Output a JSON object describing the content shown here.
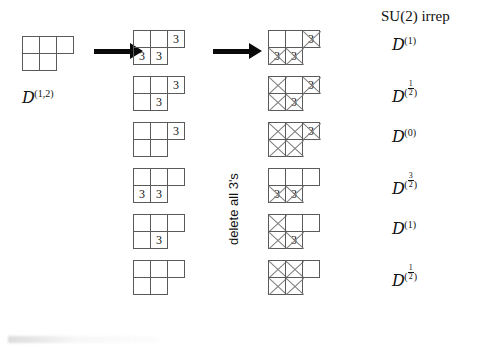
{
  "figure": {
    "header_label": "SU(2) irrep",
    "transform_label": "delete all 3's",
    "source_label": {
      "symbol": "D",
      "superscript": "(1,2)"
    }
  },
  "arrows": [
    {
      "name": "arrow-1",
      "x": 94,
      "y": 46,
      "length": 38
    },
    {
      "name": "arrow-2",
      "x": 213,
      "y": 46,
      "length": 38
    }
  ],
  "source_tableau": {
    "name": "source-tableau",
    "rows": [
      [
        {
          "text": ""
        },
        {
          "text": ""
        },
        {
          "text": ""
        }
      ],
      [
        {
          "text": ""
        },
        {
          "text": ""
        }
      ]
    ]
  },
  "rows": [
    {
      "name": "row-1",
      "filled": {
        "rows": [
          [
            {
              "text": ""
            },
            {
              "text": ""
            },
            {
              "text": "3"
            }
          ],
          [
            {
              "text": "3"
            },
            {
              "text": "3"
            }
          ]
        ]
      },
      "reduced": {
        "rows": [
          [
            {
              "text": "",
              "deleted": false
            },
            {
              "text": "",
              "deleted": false
            },
            {
              "text": "3",
              "deleted": true
            }
          ],
          [
            {
              "text": "3",
              "deleted": true
            },
            {
              "text": "3",
              "deleted": true
            }
          ]
        ]
      },
      "irrep": {
        "symbol": "D",
        "superscript": "(1)",
        "num": "",
        "den": ""
      }
    },
    {
      "name": "row-2",
      "filled": {
        "rows": [
          [
            {
              "text": ""
            },
            {
              "text": ""
            },
            {
              "text": "3"
            }
          ],
          [
            {
              "text": ""
            },
            {
              "text": "3"
            }
          ]
        ]
      },
      "reduced": {
        "rows": [
          [
            {
              "text": "",
              "deleted": true
            },
            {
              "text": "",
              "deleted": false
            },
            {
              "text": "3",
              "deleted": true
            }
          ],
          [
            {
              "text": "",
              "deleted": true
            },
            {
              "text": "3",
              "deleted": true
            }
          ]
        ]
      },
      "irrep": {
        "symbol": "D",
        "superscript": "",
        "num": "1",
        "den": "2"
      }
    },
    {
      "name": "row-3",
      "filled": {
        "rows": [
          [
            {
              "text": ""
            },
            {
              "text": ""
            },
            {
              "text": "3"
            }
          ],
          [
            {
              "text": ""
            },
            {
              "text": ""
            }
          ]
        ]
      },
      "reduced": {
        "rows": [
          [
            {
              "text": "",
              "deleted": true
            },
            {
              "text": "",
              "deleted": true
            },
            {
              "text": "3",
              "deleted": true
            }
          ],
          [
            {
              "text": "",
              "deleted": true
            },
            {
              "text": "",
              "deleted": true
            }
          ]
        ]
      },
      "irrep": {
        "symbol": "D",
        "superscript": "(0)",
        "num": "",
        "den": ""
      }
    },
    {
      "name": "row-4",
      "filled": {
        "rows": [
          [
            {
              "text": ""
            },
            {
              "text": ""
            },
            {
              "text": ""
            }
          ],
          [
            {
              "text": "3"
            },
            {
              "text": "3"
            }
          ]
        ]
      },
      "reduced": {
        "rows": [
          [
            {
              "text": "",
              "deleted": false
            },
            {
              "text": "",
              "deleted": false
            },
            {
              "text": "",
              "deleted": false
            }
          ],
          [
            {
              "text": "3",
              "deleted": true
            },
            {
              "text": "3",
              "deleted": true
            }
          ]
        ]
      },
      "irrep": {
        "symbol": "D",
        "superscript": "",
        "num": "3",
        "den": "2"
      }
    },
    {
      "name": "row-5",
      "filled": {
        "rows": [
          [
            {
              "text": ""
            },
            {
              "text": ""
            },
            {
              "text": ""
            }
          ],
          [
            {
              "text": ""
            },
            {
              "text": "3"
            }
          ]
        ]
      },
      "reduced": {
        "rows": [
          [
            {
              "text": "",
              "deleted": true
            },
            {
              "text": "",
              "deleted": false
            },
            {
              "text": "",
              "deleted": false
            }
          ],
          [
            {
              "text": "",
              "deleted": true
            },
            {
              "text": "3",
              "deleted": true
            }
          ]
        ]
      },
      "irrep": {
        "symbol": "D",
        "superscript": "(1)",
        "num": "",
        "den": ""
      }
    },
    {
      "name": "row-6",
      "filled": {
        "rows": [
          [
            {
              "text": ""
            },
            {
              "text": ""
            },
            {
              "text": ""
            }
          ],
          [
            {
              "text": ""
            },
            {
              "text": ""
            }
          ]
        ]
      },
      "reduced": {
        "rows": [
          [
            {
              "text": "",
              "deleted": true
            },
            {
              "text": "",
              "deleted": true
            },
            {
              "text": "",
              "deleted": false
            }
          ],
          [
            {
              "text": "",
              "deleted": true
            },
            {
              "text": "",
              "deleted": true
            }
          ]
        ]
      },
      "irrep": {
        "symbol": "D",
        "superscript": "",
        "num": "1",
        "den": "2"
      }
    }
  ],
  "geometry": {
    "col_source_x": 22,
    "col_filled_x": 133,
    "col_reduced_x": 268,
    "col_irrep_x": 392,
    "row_tops": [
      30,
      76,
      122,
      168,
      214,
      260,
      300
    ],
    "cell": 18
  },
  "colors": {
    "box_stroke": "#5a5a5a",
    "cross_stroke": "#7d7d7d",
    "arrow": "#0a0a0a",
    "text": "#111111",
    "background": "#ffffff"
  }
}
